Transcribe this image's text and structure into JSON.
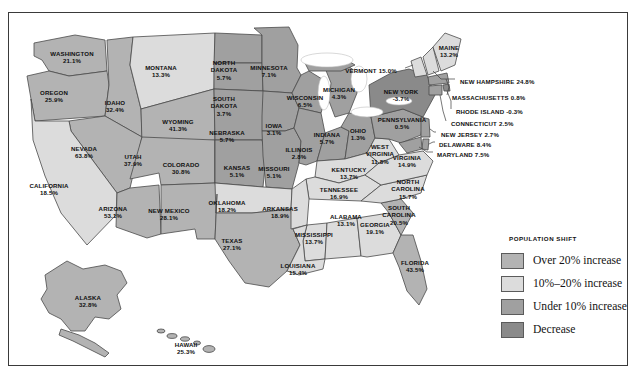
{
  "figure": {
    "kind": "choropleth-map",
    "region": "United States"
  },
  "legend": {
    "title": "POPULATION SHIFT",
    "items": [
      {
        "label": "Over 20% increase",
        "color": "#b3b3b3",
        "class": "over20"
      },
      {
        "label": "10%–20% increase",
        "color": "#dcdcdc",
        "class": "mid"
      },
      {
        "label": "Under 10% increase",
        "color": "#a0a0a0",
        "class": "under10"
      },
      {
        "label": "Decrease",
        "color": "#8a8a8a",
        "class": "decrease"
      }
    ]
  },
  "chart_data": {
    "type": "map",
    "title": "POPULATION SHIFT",
    "value_unit": "percent",
    "categories": [
      "WASHINGTON",
      "OREGON",
      "CALIFORNIA",
      "NEVADA",
      "IDAHO",
      "MONTANA",
      "WYOMING",
      "UTAH",
      "ARIZONA",
      "NEW MEXICO",
      "COLORADO",
      "NORTH DAKOTA",
      "SOUTH DAKOTA",
      "NEBRASKA",
      "KANSAS",
      "OKLAHOMA",
      "TEXAS",
      "MINNESOTA",
      "IOWA",
      "MISSOURI",
      "ARKANSAS",
      "LOUISIANA",
      "WISCONSIN",
      "ILLINOIS",
      "MICHIGAN",
      "INDIANA",
      "OHIO",
      "KENTUCKY",
      "TENNESSEE",
      "MISSISSIPPI",
      "ALABAMA",
      "GEORGIA",
      "FLORIDA",
      "SOUTH CAROLINA",
      "NORTH CAROLINA",
      "VIRGINIA",
      "WEST VIRGINIA",
      "PENNSYLVANIA",
      "NEW YORK",
      "VERMONT",
      "MAINE",
      "NEW HAMPSHIRE",
      "MASSACHUSETTS",
      "RHODE ISLAND",
      "CONNECTICUT",
      "NEW JERSEY",
      "DELAWARE",
      "MARYLAND",
      "ALASKA",
      "HAWAII"
    ],
    "values": [
      21.1,
      25.9,
      18.5,
      63.8,
      32.4,
      13.3,
      41.3,
      37.9,
      53.1,
      28.1,
      30.8,
      5.7,
      3.7,
      5.7,
      5.1,
      18.2,
      27.1,
      7.1,
      3.1,
      5.1,
      18.9,
      15.4,
      6.5,
      2.8,
      4.3,
      5.7,
      1.3,
      13.7,
      16.9,
      13.7,
      13.1,
      19.1,
      43.5,
      20.5,
      15.7,
      14.9,
      11.8,
      0.5,
      -3.7,
      15.0,
      13.2,
      24.8,
      0.8,
      -0.3,
      2.5,
      2.7,
      8.4,
      7.5,
      32.8,
      25.3
    ],
    "bins": [
      {
        "label": "Over 20% increase",
        "min": 20,
        "max": null,
        "color": "#b3b3b3"
      },
      {
        "label": "10%–20% increase",
        "min": 10,
        "max": 20,
        "color": "#dcdcdc"
      },
      {
        "label": "Under 10% increase",
        "min": 0,
        "max": 10,
        "color": "#a0a0a0"
      },
      {
        "label": "Decrease",
        "min": null,
        "max": 0,
        "color": "#8a8a8a"
      }
    ]
  },
  "states": [
    {
      "name": "WASHINGTON",
      "value": "21.1%",
      "x": 63,
      "y": 44,
      "layout": "stack",
      "bin": "over20"
    },
    {
      "name": "OREGON",
      "value": "25.9%",
      "x": 45,
      "y": 83,
      "layout": "stack",
      "bin": "over20"
    },
    {
      "name": "IDAHO",
      "value": "32.4%",
      "x": 106,
      "y": 93,
      "layout": "stack",
      "bin": "over20"
    },
    {
      "name": "MONTANA",
      "value": "13.3%",
      "x": 152,
      "y": 58,
      "layout": "stack",
      "bin": "mid"
    },
    {
      "name": "WYOMING",
      "value": "41.3%",
      "x": 169,
      "y": 112,
      "layout": "stack",
      "bin": "over20"
    },
    {
      "name": "NEVADA",
      "value": "63.8%",
      "x": 75,
      "y": 139,
      "layout": "stack",
      "bin": "over20"
    },
    {
      "name": "UTAH",
      "value": "37.9%",
      "x": 124,
      "y": 147,
      "layout": "stack",
      "bin": "over20"
    },
    {
      "name": "CALIFORNIA",
      "value": "18.5%",
      "x": 40,
      "y": 176,
      "layout": "stack",
      "bin": "mid"
    },
    {
      "name": "ARIZONA",
      "value": "53.1%",
      "x": 104,
      "y": 199,
      "layout": "stack",
      "bin": "over20"
    },
    {
      "name": "COLORADO",
      "value": "30.8%",
      "x": 172,
      "y": 155,
      "layout": "stack",
      "bin": "over20"
    },
    {
      "name": "NEW MEXICO",
      "value": "28.1%",
      "x": 160,
      "y": 201,
      "layout": "stack",
      "bin": "over20"
    },
    {
      "name": "NORTH DAKOTA",
      "value": "5.7%",
      "x": 215,
      "y": 57,
      "layout": "stack3",
      "bin": "under10"
    },
    {
      "name": "SOUTH DAKOTA",
      "value": "3.7%",
      "x": 215,
      "y": 93,
      "layout": "stack3",
      "bin": "under10"
    },
    {
      "name": "MINNESOTA",
      "value": "7.1%",
      "x": 260,
      "y": 58,
      "layout": "stack",
      "bin": "under10"
    },
    {
      "name": "NEBRASKA",
      "value": "5.7%",
      "x": 218,
      "y": 123,
      "layout": "stack",
      "bin": "under10"
    },
    {
      "name": "KANSAS",
      "value": "5.1%",
      "x": 228,
      "y": 158,
      "layout": "stack",
      "bin": "under10"
    },
    {
      "name": "IOWA",
      "value": "3.1%",
      "x": 265,
      "y": 116,
      "layout": "stack",
      "bin": "under10"
    },
    {
      "name": "WISCONSIN",
      "value": "6.5%",
      "x": 296,
      "y": 88,
      "layout": "stack",
      "bin": "under10"
    },
    {
      "name": "ILLINOIS",
      "value": "2.8%",
      "x": 290,
      "y": 140,
      "layout": "stack",
      "bin": "under10"
    },
    {
      "name": "MISSOURI",
      "value": "5.1%",
      "x": 265,
      "y": 159,
      "layout": "stack",
      "bin": "under10"
    },
    {
      "name": "OKLAHOMA",
      "value": "18.2%",
      "x": 218,
      "y": 193,
      "layout": "stack",
      "bin": "mid"
    },
    {
      "name": "ARKANSAS",
      "value": "18.9%",
      "x": 271,
      "y": 199,
      "layout": "stack",
      "bin": "mid"
    },
    {
      "name": "TEXAS",
      "value": "27.1%",
      "x": 223,
      "y": 231,
      "layout": "stack",
      "bin": "over20"
    },
    {
      "name": "LOUISIANA",
      "value": "15.4%",
      "x": 289,
      "y": 256,
      "layout": "stack",
      "bin": "mid"
    },
    {
      "name": "MISSISSIPPI",
      "value": "13.7%",
      "x": 305,
      "y": 225,
      "layout": "stack",
      "bin": "mid"
    },
    {
      "name": "ALABAMA",
      "value": "13.1%",
      "x": 337,
      "y": 207,
      "layout": "stack",
      "bin": "mid"
    },
    {
      "name": "TENNESSEE",
      "value": "16.9%",
      "x": 330,
      "y": 180,
      "layout": "stack",
      "bin": "mid"
    },
    {
      "name": "KENTUCKY",
      "value": "13.7%",
      "x": 340,
      "y": 160,
      "layout": "stack",
      "bin": "mid"
    },
    {
      "name": "MICHIGAN",
      "value": "4.3%",
      "x": 330,
      "y": 80,
      "layout": "stack",
      "bin": "under10"
    },
    {
      "name": "INDIANA",
      "value": "5.7%",
      "x": 318,
      "y": 125,
      "layout": "stack",
      "bin": "under10"
    },
    {
      "name": "OHIO",
      "value": "1.3%",
      "x": 349,
      "y": 121,
      "layout": "stack",
      "bin": "under10"
    },
    {
      "name": "WEST VIRGINIA",
      "value": "11.8%",
      "x": 371,
      "y": 141,
      "layout": "stack3",
      "bin": "mid"
    },
    {
      "name": "VIRGINIA",
      "value": "14.9%",
      "x": 398,
      "y": 148,
      "layout": "stack",
      "bin": "mid"
    },
    {
      "name": "NORTH CAROLINA",
      "value": "15.7%",
      "x": 399,
      "y": 176,
      "layout": "stack3",
      "bin": "mid"
    },
    {
      "name": "SOUTH CAROLINA",
      "value": "20.5%",
      "x": 390,
      "y": 202,
      "layout": "stack3",
      "bin": "over20"
    },
    {
      "name": "GEORGIA",
      "value": "19.1%",
      "x": 366,
      "y": 215,
      "layout": "stack",
      "bin": "mid"
    },
    {
      "name": "FLORIDA",
      "value": "43.5%",
      "x": 406,
      "y": 253,
      "layout": "stack",
      "bin": "over20"
    },
    {
      "name": "PENNSYLVANIA",
      "value": "0.5%",
      "x": 393,
      "y": 110,
      "layout": "stack",
      "bin": "under10"
    },
    {
      "name": "NEW YORK",
      "value": "-3.7%",
      "x": 392,
      "y": 82,
      "layout": "stack",
      "bin": "decrease"
    },
    {
      "name": "VERMONT",
      "value": "15.0%",
      "x": 362,
      "y": 58,
      "layout": "inline",
      "bin": "mid"
    },
    {
      "name": "MAINE",
      "value": "13.2%",
      "x": 440,
      "y": 38,
      "layout": "stack",
      "bin": "mid"
    },
    {
      "name": "ALASKA",
      "value": "32.8%",
      "x": 79,
      "y": 288,
      "layout": "stack",
      "bin": "over20"
    },
    {
      "name": "HAWAII",
      "value": "25.3%",
      "x": 177,
      "y": 335,
      "layout": "stack",
      "bin": "over20"
    }
  ],
  "callouts": [
    {
      "name": "NEW HAMPSHIRE",
      "value": "24.8%",
      "x": 451,
      "y": 69,
      "bin": "over20"
    },
    {
      "name": "MASSACHUSETTS",
      "value": "0.8%",
      "x": 443,
      "y": 85,
      "bin": "under10"
    },
    {
      "name": "RHODE ISLAND",
      "value": "-0.3%",
      "x": 447,
      "y": 99,
      "bin": "decrease"
    },
    {
      "name": "CONNECTICUT",
      "value": "2.5%",
      "x": 442,
      "y": 111,
      "bin": "under10"
    },
    {
      "name": "NEW JERSEY",
      "value": "2.7%",
      "x": 432,
      "y": 122,
      "bin": "under10"
    },
    {
      "name": "DELAWARE",
      "value": "8.4%",
      "x": 430,
      "y": 132,
      "bin": "under10"
    },
    {
      "name": "MARYLAND",
      "value": "7.5%",
      "x": 428,
      "y": 142,
      "bin": "under10"
    }
  ]
}
